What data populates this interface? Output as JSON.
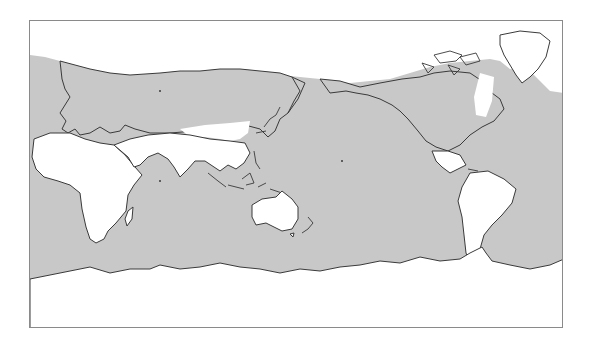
{
  "map": {
    "projection": "equirectangular, Pacific-centred (prime meridian at left edge)",
    "colors": {
      "background": "#ffffff",
      "shaded_region": "#c8c8c8",
      "unshaded_region": "#ffffff",
      "coastline": "#3a3a3a",
      "frame": "#8a8a8a"
    },
    "legend": [],
    "labels": [],
    "regions": {
      "shaded": [
        "oceans",
        "northern Eurasia (boreal belt)",
        "Europe",
        "North America",
        "Canadian Arctic Archipelago",
        "Southern Ocean"
      ],
      "unshaded": [
        "Arctic Ocean / polar cap",
        "Africa",
        "Arabia",
        "Central and South Asia",
        "Australia interior",
        "Greenland",
        "Labrador",
        "Mexico and Central America",
        "South America",
        "Antarctica"
      ]
    }
  }
}
